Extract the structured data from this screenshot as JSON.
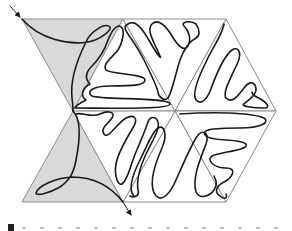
{
  "figure": {
    "colors": {
      "background": "#ffffff",
      "shaded_triangle": "#d9d9d9",
      "edge": "#8c8c8c",
      "curve": "#1a1a1a"
    },
    "vertices": {
      "outer_top_left": [
        22,
        19
      ],
      "hex_top_left": [
        123,
        19
      ],
      "hex_top_right": [
        226,
        19
      ],
      "hex_right": [
        276,
        111
      ],
      "hex_bottom_right": [
        226,
        202
      ],
      "hex_bottom_left": [
        123,
        202
      ],
      "outer_bottom_left": [
        22,
        202
      ],
      "hex_left": [
        73,
        111
      ],
      "hex_center": [
        175,
        111
      ]
    },
    "arrows": [
      {
        "name": "entry-arrow",
        "from": [
          8,
          4
        ],
        "to": [
          22,
          19
        ]
      },
      {
        "name": "exit-arrow",
        "from": [
          123,
          202
        ],
        "to": [
          132,
          217
        ]
      }
    ]
  },
  "caption": {
    "label": "7"
  }
}
